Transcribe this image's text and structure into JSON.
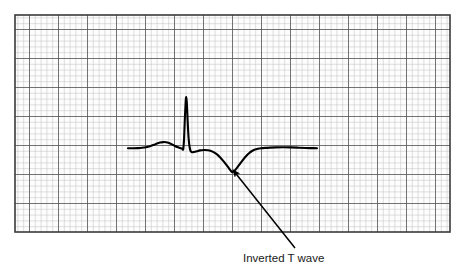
{
  "figure": {
    "background_color": "#ffffff"
  },
  "grid": {
    "name": "ecg-graph-paper",
    "x": 15,
    "y": 15,
    "width": 435,
    "height": 217,
    "minor_cell_px": 5.8,
    "major_cell_px": 29,
    "minor_color": "#b5b5b5",
    "major_color": "#4a4a4a",
    "border_color": "#3a3a3a",
    "paper_color": "#fdfdfd"
  },
  "annotation": {
    "label": "Inverted T wave",
    "label_x": 243,
    "label_y": 262,
    "arrow_color": "#000000",
    "arrow_tail_x": 295,
    "arrow_tail_y": 248,
    "arrow_head_x": 233,
    "arrow_head_y": 170
  },
  "chart_data": {
    "type": "line",
    "title": "Inverted T wave",
    "xlabel": "",
    "ylabel": "",
    "legend_position": "none",
    "grid": true,
    "trace_color": "#000000",
    "trace_width": 2.1,
    "baseline_y": 148,
    "xlim": [
      128,
      317
    ],
    "ylim": [
      97,
      173
    ],
    "features": [
      {
        "name": "baseline-start",
        "x": 128,
        "y": 148
      },
      {
        "name": "p-wave-peak",
        "x": 164,
        "y": 142
      },
      {
        "name": "q-dip",
        "x": 182,
        "y": 149
      },
      {
        "name": "r-peak",
        "x": 186,
        "y": 97
      },
      {
        "name": "s-dip",
        "x": 192,
        "y": 152
      },
      {
        "name": "st-segment",
        "x": 205,
        "y": 150
      },
      {
        "name": "inverted-t-trough",
        "x": 232,
        "y": 172
      },
      {
        "name": "t-recovery",
        "x": 262,
        "y": 148
      },
      {
        "name": "baseline-end",
        "x": 317,
        "y": 148
      }
    ],
    "points": [
      [
        128,
        148.2
      ],
      [
        133,
        148.2
      ],
      [
        138,
        148.1
      ],
      [
        142,
        147.8
      ],
      [
        146,
        147.2
      ],
      [
        150,
        146.2
      ],
      [
        154,
        144.8
      ],
      [
        157,
        143.5
      ],
      [
        160,
        142.6
      ],
      [
        163,
        142.1
      ],
      [
        166,
        142.2
      ],
      [
        169,
        143.0
      ],
      [
        172,
        144.4
      ],
      [
        175,
        146.0
      ],
      [
        178,
        147.3
      ],
      [
        180,
        148.0
      ],
      [
        182,
        148.6
      ],
      [
        183.2,
        149.2
      ],
      [
        184,
        140.0
      ],
      [
        184.8,
        120.0
      ],
      [
        185.6,
        103.0
      ],
      [
        186.2,
        97.2
      ],
      [
        186.9,
        104.0
      ],
      [
        187.7,
        122.0
      ],
      [
        188.6,
        138.0
      ],
      [
        189.6,
        147.0
      ],
      [
        190.6,
        151.0
      ],
      [
        192,
        152.2
      ],
      [
        194,
        152.0
      ],
      [
        197,
        151.2
      ],
      [
        200,
        150.4
      ],
      [
        204,
        150.0
      ],
      [
        208,
        150.2
      ],
      [
        211,
        151.0
      ],
      [
        214,
        152.4
      ],
      [
        217,
        154.4
      ],
      [
        220,
        157.2
      ],
      [
        223,
        160.6
      ],
      [
        226,
        164.4
      ],
      [
        229,
        168.4
      ],
      [
        231,
        171.0
      ],
      [
        232.5,
        172.2
      ],
      [
        234,
        171.2
      ],
      [
        237,
        167.8
      ],
      [
        240,
        163.8
      ],
      [
        243,
        159.8
      ],
      [
        246,
        156.2
      ],
      [
        249,
        153.2
      ],
      [
        252,
        151.0
      ],
      [
        255,
        149.6
      ],
      [
        258,
        148.8
      ],
      [
        261,
        148.3
      ],
      [
        265,
        147.9
      ],
      [
        270,
        147.6
      ],
      [
        276,
        147.4
      ],
      [
        283,
        147.3
      ],
      [
        291,
        147.4
      ],
      [
        299,
        147.7
      ],
      [
        306,
        148.0
      ],
      [
        311,
        148.1
      ],
      [
        317,
        148.2
      ]
    ]
  }
}
